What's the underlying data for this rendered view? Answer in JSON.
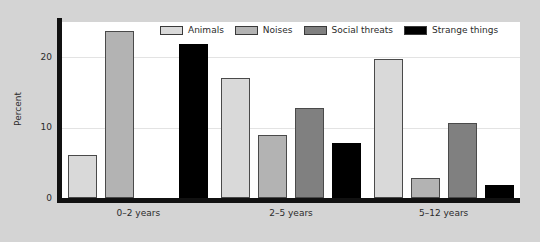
{
  "chart_data": {
    "type": "bar",
    "title": "",
    "xlabel": "",
    "ylabel": "Percent",
    "categories": [
      "0–2 years",
      "2–5 years",
      "5–12 years"
    ],
    "series": [
      {
        "name": "Animals",
        "color": "#d9d9d9",
        "values": [
          6.1,
          17.0,
          19.7
        ]
      },
      {
        "name": "Noises",
        "color": "#b3b3b3",
        "values": [
          23.7,
          9.0,
          2.9
        ]
      },
      {
        "name": "Social threats",
        "color": "#808080",
        "values": [
          0,
          12.8,
          10.6
        ]
      },
      {
        "name": "Strange things",
        "color": "#000000",
        "values": [
          21.8,
          7.8,
          1.8
        ]
      }
    ],
    "ylim": [
      0,
      25
    ],
    "yticks": [
      0,
      10,
      20
    ],
    "ytick_labels": [
      "0",
      "10",
      "20"
    ],
    "grid": true,
    "legend_position": "top-center",
    "panel_background": "#ffffff",
    "figure_background": "#d4d4d4",
    "axis_color": "#111111",
    "gridline_color": "#e3e3e3"
  },
  "figure": {
    "axis_title_y": "Percent"
  }
}
